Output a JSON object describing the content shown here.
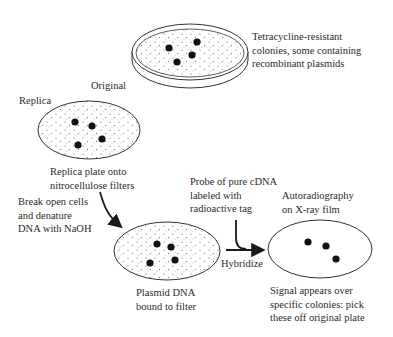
{
  "diagram": {
    "stages": {
      "original": {
        "label": "Original",
        "note": [
          "Tetracycline-resistant",
          "colonies, some containing",
          "recombinant plasmids"
        ],
        "colonies": 4
      },
      "replica": {
        "label": "Replica",
        "note": [
          "Replica plate onto",
          "nitrocellulose filters"
        ],
        "colonies": 4
      },
      "denature": {
        "note": [
          "Break open cells",
          "and denature",
          "DNA with NaOH"
        ]
      },
      "filter": {
        "note": [
          "Plasmid DNA",
          "bound to filter"
        ],
        "colonies": 4
      },
      "probe": {
        "note": [
          "Probe of pure cDNA",
          "labeled with",
          "radioactive tag"
        ]
      },
      "hybridize": {
        "label": "Hybridize"
      },
      "film": {
        "title": [
          "Autoradiography",
          "on X-ray film"
        ],
        "note": [
          "Signal appears over",
          "specific colonies: pick",
          "these off original plate"
        ],
        "spots": 3
      }
    },
    "colors": {
      "ink": "#1a1a1a",
      "background": "#ffffff"
    }
  }
}
